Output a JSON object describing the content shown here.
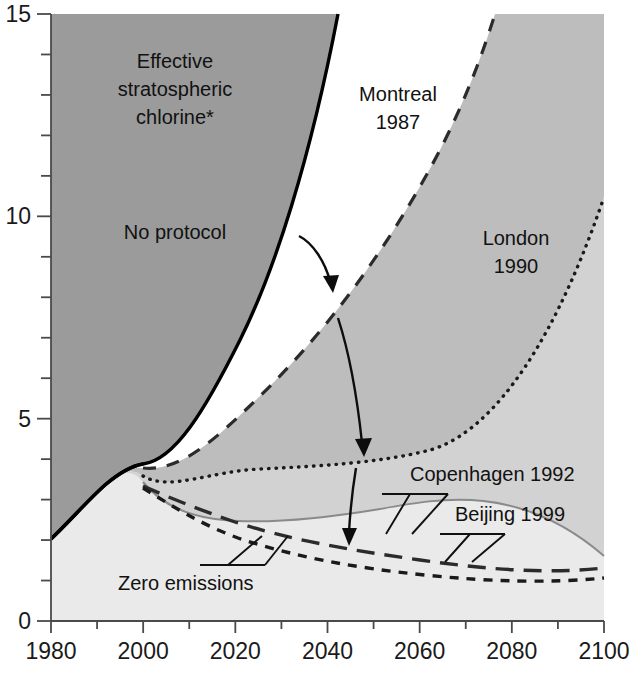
{
  "chart_data": {
    "type": "area",
    "title": "",
    "subtitle": "",
    "xlabel": "",
    "ylabel": "",
    "axis_note": "Effective stratospheric chlorine*",
    "xlim": [
      1980,
      2100
    ],
    "ylim": [
      0,
      15
    ],
    "x_ticks_major": [
      "1980",
      "2000",
      "2020",
      "2040",
      "2060",
      "2080",
      "2100"
    ],
    "x_ticks_major_values": [
      1980,
      2000,
      2020,
      2040,
      2060,
      2080,
      2100
    ],
    "x_tick_minor_step": 10,
    "y_ticks_major": [
      "0",
      "5",
      "10",
      "15"
    ],
    "y_ticks_major_values": [
      0,
      5,
      10,
      15
    ],
    "y_tick_minor_step": 1,
    "grid": false,
    "legend_position": "inline-annotations",
    "x": [
      1980,
      1985,
      1990,
      1995,
      2000,
      2010,
      2020,
      2030,
      2040,
      2050,
      2060,
      2070,
      2080,
      2090,
      2100
    ],
    "series": [
      {
        "name": "No protocol",
        "label": "No protocol",
        "line_style": "solid",
        "color": "#000000",
        "fill": "#9b9b9b",
        "values": [
          2.0,
          2.5,
          3.0,
          3.4,
          4.1,
          5.8,
          7.9,
          10.3,
          13.2,
          16.5,
          20.2,
          24.3,
          28.8,
          33.7,
          39.0
        ]
      },
      {
        "name": "Montreal 1987",
        "label": "Montreal\n1987",
        "line_style": "dashed",
        "color": "#2b2b2b",
        "fill": "#bdbdbd",
        "values": [
          2.0,
          2.5,
          3.0,
          3.4,
          3.7,
          4.2,
          4.9,
          5.7,
          6.7,
          7.9,
          9.3,
          11.0,
          13.0,
          15.4,
          18.2
        ]
      },
      {
        "name": "London 1990",
        "label": "London\n1990",
        "line_style": "dotted",
        "color": "#1a1a1a",
        "fill": "#d2d2d2",
        "values": [
          2.0,
          2.5,
          3.0,
          3.4,
          3.6,
          3.6,
          3.6,
          3.7,
          4.0,
          4.6,
          5.5,
          6.7,
          8.1,
          9.1,
          10.3
        ]
      },
      {
        "name": "Copenhagen 1992",
        "label": "Copenhagen 1992",
        "line_style": "solid-thin",
        "color": "#8a8a8a",
        "fill": "#eaeaea",
        "values": [
          2.0,
          2.5,
          3.0,
          3.4,
          3.45,
          3.4,
          3.3,
          3.1,
          2.9,
          2.65,
          2.4,
          2.15,
          1.95,
          1.75,
          1.6
        ]
      },
      {
        "name": "Beijing 1999",
        "label": "Beijing 1999",
        "line_style": "long-dashed",
        "color": "#2b2b2b",
        "fill": "none",
        "values": [
          2.0,
          2.5,
          3.0,
          3.4,
          3.4,
          3.25,
          3.05,
          2.85,
          2.6,
          2.35,
          2.15,
          1.95,
          1.75,
          1.55,
          1.4
        ]
      },
      {
        "name": "Zero emissions",
        "label": "Zero emissions",
        "line_style": "short-dashed",
        "color": "#1a1a1a",
        "fill": "none",
        "values": [
          2.0,
          2.5,
          3.0,
          3.4,
          3.35,
          3.05,
          2.75,
          2.5,
          2.25,
          2.0,
          1.8,
          1.6,
          1.4,
          1.25,
          1.1
        ]
      }
    ],
    "annotations": [
      {
        "name": "effective-stratospheric-chlorine",
        "text_lines": [
          "Effective",
          "stratospheric",
          "chlorine*"
        ],
        "x": 175,
        "y": 68
      },
      {
        "name": "no-protocol",
        "text_lines": [
          "No protocol"
        ],
        "x": 175,
        "y": 239
      },
      {
        "name": "montreal-1987",
        "text_lines": [
          "Montreal",
          "1987"
        ],
        "x": 398,
        "y": 101
      },
      {
        "name": "london-1990",
        "text_lines": [
          "London",
          "1990"
        ],
        "x": 516,
        "y": 245
      },
      {
        "name": "copenhagen-1992",
        "text_lines": [
          "Copenhagen 1992"
        ],
        "x": 497,
        "y": 481
      },
      {
        "name": "beijing-1999",
        "text_lines": [
          "Beijing 1999"
        ],
        "x": 530,
        "y": 521
      },
      {
        "name": "zero-emissions",
        "text_lines": [
          "Zero emissions"
        ],
        "x": 196,
        "y": 583
      }
    ],
    "arrows": [
      {
        "name": "arrow-no-protocol-to-montreal",
        "from": [
          300,
          238
        ],
        "to": [
          332,
          286
        ]
      },
      {
        "name": "arrow-montreal-to-london",
        "from": [
          339,
          320
        ],
        "to": [
          364,
          452
        ]
      },
      {
        "name": "arrow-london-to-copenhagen",
        "from": [
          358,
          470
        ],
        "to": [
          349,
          542
        ]
      }
    ]
  },
  "footnote": {
    "marker": "*",
    "attached_to": "chlorine"
  }
}
